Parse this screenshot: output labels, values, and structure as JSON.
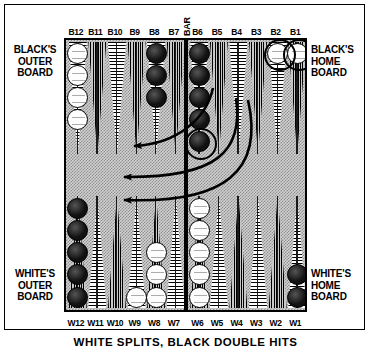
{
  "figure": {
    "caption": "WHITE SPLITS, BLACK DOUBLE HITS",
    "bar_label": "BAR"
  },
  "quadrant_labels": {
    "black_outer": [
      "BLACK'S",
      "OUTER",
      "BOARD"
    ],
    "black_home": [
      "BLACK'S",
      "HOME",
      "BOARD"
    ],
    "white_outer": [
      "WHITE'S",
      "OUTER",
      "BOARD"
    ],
    "white_home": [
      "WHITE'S",
      "HOME",
      "BOARD"
    ]
  },
  "top_point_labels": [
    "B12",
    "B11",
    "B10",
    "B9",
    "B8",
    "B7",
    "B6",
    "B5",
    "B4",
    "B3",
    "B2",
    "B1"
  ],
  "bottom_point_labels": [
    "W12",
    "W11",
    "W10",
    "W9",
    "W8",
    "W7",
    "W6",
    "W5",
    "W4",
    "W3",
    "W2",
    "W1"
  ],
  "colors": {
    "white_checker": "#fdfdfd",
    "black_checker": "#1a1a1a",
    "board_felt": "#d2d2d2",
    "frame": "#000000"
  },
  "chart_data": {
    "type": "table",
    "title": "WHITE SPLITS, BLACK DOUBLE HITS",
    "top_points": [
      {
        "label": "B12",
        "color": "white",
        "count": 4,
        "highlighted": false
      },
      {
        "label": "B11",
        "color": "none",
        "count": 0,
        "highlighted": false
      },
      {
        "label": "B10",
        "color": "none",
        "count": 0,
        "highlighted": false
      },
      {
        "label": "B9",
        "color": "none",
        "count": 0,
        "highlighted": false
      },
      {
        "label": "B8",
        "color": "black",
        "count": 3,
        "highlighted": false
      },
      {
        "label": "B7",
        "color": "none",
        "count": 0,
        "highlighted": false
      },
      {
        "label": "B6",
        "color": "black",
        "count": 5,
        "highlighted": true
      },
      {
        "label": "B5",
        "color": "none",
        "count": 0,
        "highlighted": false
      },
      {
        "label": "B4",
        "color": "none",
        "count": 0,
        "highlighted": false
      },
      {
        "label": "B3",
        "color": "none",
        "count": 0,
        "highlighted": false
      },
      {
        "label": "B2",
        "color": "white",
        "count": 1,
        "highlighted": true
      },
      {
        "label": "B1",
        "color": "white",
        "count": 1,
        "highlighted": true
      }
    ],
    "bottom_points": [
      {
        "label": "W12",
        "color": "black",
        "count": 5,
        "highlighted": false
      },
      {
        "label": "W11",
        "color": "none",
        "count": 0,
        "highlighted": false
      },
      {
        "label": "W10",
        "color": "none",
        "count": 0,
        "highlighted": false
      },
      {
        "label": "W9",
        "color": "white",
        "count": 1,
        "highlighted": false
      },
      {
        "label": "W8",
        "color": "white",
        "count": 3,
        "highlighted": false
      },
      {
        "label": "W7",
        "color": "none",
        "count": 0,
        "highlighted": false
      },
      {
        "label": "W6",
        "color": "white",
        "count": 5,
        "highlighted": false
      },
      {
        "label": "W5",
        "color": "none",
        "count": 0,
        "highlighted": false
      },
      {
        "label": "W4",
        "color": "none",
        "count": 0,
        "highlighted": false
      },
      {
        "label": "W3",
        "color": "none",
        "count": 0,
        "highlighted": false
      },
      {
        "label": "W2",
        "color": "none",
        "count": 0,
        "highlighted": false
      },
      {
        "label": "W1",
        "color": "black",
        "count": 2,
        "highlighted": false
      }
    ],
    "arrows": [
      {
        "from": "B2",
        "to": "B6",
        "note": "black hits the blot on B6 area"
      },
      {
        "from": "B1",
        "to": "BAR",
        "note": "white checker sent to the bar"
      },
      {
        "from": "B2",
        "to": "BAR",
        "note": "white checker sent to the bar"
      }
    ]
  }
}
